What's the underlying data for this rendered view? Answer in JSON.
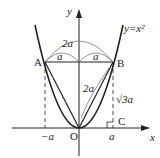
{
  "diagram": {
    "curve_label": "y=x²",
    "axis_x": "x",
    "axis_y": "y",
    "origin": "O",
    "points": {
      "A": "A",
      "B": "B",
      "C": "C"
    },
    "labels": {
      "top_arc": "2a",
      "left_half": "a",
      "right_half": "a",
      "slant": "2a",
      "height": "√3a",
      "neg_a": "−a",
      "pos_a": "a"
    }
  }
}
